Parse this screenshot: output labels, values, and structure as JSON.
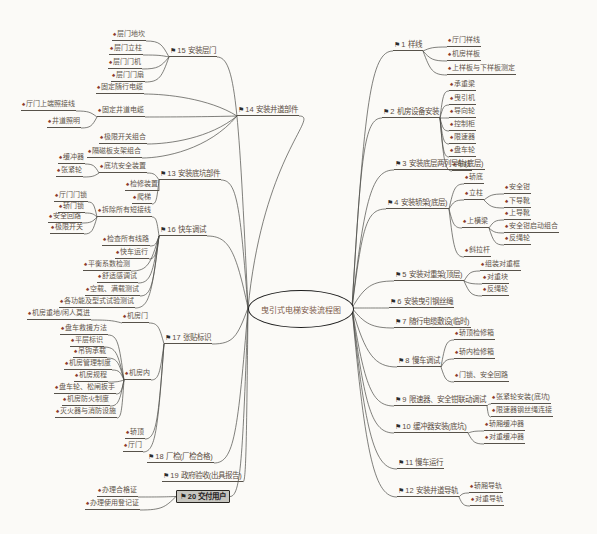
{
  "title": "曳引式电梯安装流程图",
  "center": {
    "label": "曳引式电梯安装流程图",
    "x": 300,
    "y": 308,
    "rx": 52,
    "ry": 18
  },
  "icons": {
    "main": "⚑",
    "sub": "♠"
  },
  "colors": {
    "line": "#4a4a46",
    "text": "#5f554b",
    "main_flag": "#2b2b2b",
    "sub_pin": "#8b3a2a",
    "background": "#fbfaf7",
    "box_fill": "#c6c5bf"
  },
  "nodes": [
    {
      "id": "n1",
      "parent": "center",
      "side": "right",
      "type": "main",
      "x": 393,
      "y": 40,
      "label": "1 样线"
    },
    {
      "id": "n1a",
      "parent": "n1",
      "side": "right",
      "type": "sub",
      "x": 447,
      "y": 35,
      "label": "厅门样线"
    },
    {
      "id": "n1b",
      "parent": "n1",
      "side": "right",
      "type": "sub",
      "x": 447,
      "y": 49,
      "label": "机房样板"
    },
    {
      "id": "n1c",
      "parent": "n1",
      "side": "right",
      "type": "sub",
      "x": 447,
      "y": 63,
      "label": "上样板与下样板测定"
    },
    {
      "id": "n2",
      "parent": "center",
      "side": "right",
      "type": "main",
      "x": 382,
      "y": 107,
      "label": "2 机房设备安装"
    },
    {
      "id": "n2a",
      "parent": "n2",
      "side": "right",
      "type": "sub",
      "x": 449,
      "y": 79,
      "label": "承重梁"
    },
    {
      "id": "n2b",
      "parent": "n2",
      "side": "right",
      "type": "sub",
      "x": 449,
      "y": 93,
      "label": "曳引机"
    },
    {
      "id": "n2c",
      "parent": "n2",
      "side": "right",
      "type": "sub",
      "x": 449,
      "y": 106,
      "label": "导向轮"
    },
    {
      "id": "n2d",
      "parent": "n2",
      "side": "right",
      "type": "sub",
      "x": 449,
      "y": 119,
      "label": "控制柜"
    },
    {
      "id": "n2e",
      "parent": "n2",
      "side": "right",
      "type": "sub",
      "x": 449,
      "y": 132,
      "label": "限速器"
    },
    {
      "id": "n2f",
      "parent": "n2",
      "side": "right",
      "type": "sub",
      "x": 449,
      "y": 145,
      "label": "盘车轮"
    },
    {
      "id": "n2g",
      "parent": "n2",
      "side": "right",
      "type": "sub",
      "x": 452,
      "y": 159,
      "label": "布线"
    },
    {
      "id": "n3",
      "parent": "center",
      "side": "right",
      "type": "main",
      "x": 394,
      "y": 159,
      "label": "3 安装底层两列导轨(底层)"
    },
    {
      "id": "n4",
      "parent": "center",
      "side": "right",
      "type": "main",
      "x": 386,
      "y": 198,
      "label": "4 安装轿架(底层)"
    },
    {
      "id": "n4a",
      "parent": "n4",
      "side": "right",
      "type": "sub",
      "x": 464,
      "y": 172,
      "label": "轿底"
    },
    {
      "id": "n4b",
      "parent": "n4",
      "side": "right",
      "type": "sub",
      "x": 464,
      "y": 188,
      "label": "立柱"
    },
    {
      "id": "n4b1",
      "parent": "n4b",
      "side": "right",
      "type": "sub",
      "x": 504,
      "y": 182,
      "label": "安全钳"
    },
    {
      "id": "n4b2",
      "parent": "n4b",
      "side": "right",
      "type": "sub",
      "x": 504,
      "y": 196,
      "label": "下导靴"
    },
    {
      "id": "n4c",
      "parent": "n4",
      "side": "right",
      "type": "sub",
      "x": 462,
      "y": 216,
      "label": "上横梁"
    },
    {
      "id": "n4c1",
      "parent": "n4c",
      "side": "right",
      "type": "sub",
      "x": 504,
      "y": 208,
      "label": "上导靴"
    },
    {
      "id": "n4c2",
      "parent": "n4c",
      "side": "right",
      "type": "sub",
      "x": 504,
      "y": 221,
      "label": "安全钳启动组合"
    },
    {
      "id": "n4c3",
      "parent": "n4c",
      "side": "right",
      "type": "sub",
      "x": 504,
      "y": 233,
      "label": "反绳轮"
    },
    {
      "id": "n4d",
      "parent": "n4",
      "side": "right",
      "type": "sub",
      "x": 464,
      "y": 245,
      "label": "斜拉杆"
    },
    {
      "id": "n5",
      "parent": "center",
      "side": "right",
      "type": "main",
      "x": 394,
      "y": 270,
      "label": "5 安装对重架(顶层)"
    },
    {
      "id": "n5a",
      "parent": "n5",
      "side": "right",
      "type": "sub",
      "x": 480,
      "y": 259,
      "label": "组装对重框"
    },
    {
      "id": "n5b",
      "parent": "n5",
      "side": "right",
      "type": "sub",
      "x": 482,
      "y": 272,
      "label": "对重块"
    },
    {
      "id": "n5c",
      "parent": "n5",
      "side": "right",
      "type": "sub",
      "x": 482,
      "y": 284,
      "label": "反绳轮"
    },
    {
      "id": "n6",
      "parent": "center",
      "side": "right",
      "type": "main",
      "x": 389,
      "y": 297,
      "label": "6 安装曳引钢丝绳"
    },
    {
      "id": "n7",
      "parent": "center",
      "side": "right",
      "type": "main",
      "x": 394,
      "y": 317,
      "label": "7 随行电缆敷设(临时)"
    },
    {
      "id": "n8",
      "parent": "center",
      "side": "right",
      "type": "main",
      "x": 397,
      "y": 356,
      "label": "8 慢车调试"
    },
    {
      "id": "n8a",
      "parent": "n8",
      "side": "right",
      "type": "sub",
      "x": 454,
      "y": 328,
      "label": "轿顶检修箱"
    },
    {
      "id": "n8b",
      "parent": "n8",
      "side": "right",
      "type": "sub",
      "x": 454,
      "y": 347,
      "label": "轿内检修箱"
    },
    {
      "id": "n8c",
      "parent": "n8",
      "side": "right",
      "type": "sub",
      "x": 454,
      "y": 370,
      "label": "门锁、安全回路"
    },
    {
      "id": "n9",
      "parent": "center",
      "side": "right",
      "type": "main",
      "x": 394,
      "y": 395,
      "label": "9 限速器、安全钳联动调试"
    },
    {
      "id": "n9a",
      "parent": "n9",
      "side": "right",
      "type": "sub",
      "x": 491,
      "y": 392,
      "label": "张紧轮安装(底坑)"
    },
    {
      "id": "n9b",
      "parent": "n9",
      "side": "right",
      "type": "sub",
      "x": 491,
      "y": 405,
      "label": "限速器钢丝绳连接"
    },
    {
      "id": "n10",
      "parent": "center",
      "side": "right",
      "type": "main",
      "x": 394,
      "y": 422,
      "label": "10 缓冲器安装(底坑)"
    },
    {
      "id": "n10a",
      "parent": "n10",
      "side": "right",
      "type": "sub",
      "x": 484,
      "y": 419,
      "label": "轿厢缓冲器"
    },
    {
      "id": "n10b",
      "parent": "n10",
      "side": "right",
      "type": "sub",
      "x": 484,
      "y": 432,
      "label": "对重缓冲器"
    },
    {
      "id": "n11",
      "parent": "center",
      "side": "right",
      "type": "main",
      "x": 397,
      "y": 458,
      "label": "11 慢车运行"
    },
    {
      "id": "n12",
      "parent": "center",
      "side": "right",
      "type": "main",
      "x": 397,
      "y": 486,
      "label": "12 安装井道导轨"
    },
    {
      "id": "n12a",
      "parent": "n12",
      "side": "right",
      "type": "sub",
      "x": 469,
      "y": 481,
      "label": "轿厢导轨"
    },
    {
      "id": "n12b",
      "parent": "n12",
      "side": "right",
      "type": "sub",
      "x": 470,
      "y": 494,
      "label": "对重导轨"
    },
    {
      "id": "n15",
      "parent": "center",
      "side": "left",
      "type": "main",
      "x": 169,
      "y": 46,
      "label": "15 安装层门"
    },
    {
      "id": "n15a",
      "parent": "n15",
      "side": "left",
      "type": "sub",
      "x": 112,
      "y": 29,
      "label": "层门地坎"
    },
    {
      "id": "n15b",
      "parent": "n15",
      "side": "left",
      "type": "sub",
      "x": 109,
      "y": 43,
      "label": "层门立柱"
    },
    {
      "id": "n15c",
      "parent": "n15",
      "side": "left",
      "type": "sub",
      "x": 108,
      "y": 57,
      "label": "层门门机"
    },
    {
      "id": "n15d",
      "parent": "n15",
      "side": "left",
      "type": "sub",
      "x": 111,
      "y": 70,
      "label": "层门门扇"
    },
    {
      "id": "n14",
      "parent": "center",
      "side": "left",
      "type": "main",
      "x": 237,
      "y": 105,
      "label": "14 安装井道部件"
    },
    {
      "id": "n14a",
      "parent": "n14",
      "side": "left",
      "type": "sub",
      "x": 96,
      "y": 82,
      "label": "固定随行电缆"
    },
    {
      "id": "n14b",
      "parent": "n14",
      "side": "left",
      "type": "sub",
      "x": 97,
      "y": 105,
      "label": "固定井道电缆"
    },
    {
      "id": "n14b1",
      "parent": "n14b",
      "side": "left",
      "type": "sub",
      "x": 21,
      "y": 99,
      "label": "厅门上端照接线"
    },
    {
      "id": "n14b2",
      "parent": "n14b",
      "side": "left",
      "type": "sub",
      "x": 47,
      "y": 116,
      "label": "井道照明"
    },
    {
      "id": "n14c",
      "parent": "n14",
      "side": "left",
      "type": "sub",
      "x": 99,
      "y": 132,
      "label": "极限开关组合"
    },
    {
      "id": "n14d",
      "parent": "n14",
      "side": "left",
      "type": "sub",
      "x": 87,
      "y": 146,
      "label": "隔磁板支架组合"
    },
    {
      "id": "n13",
      "parent": "center",
      "side": "left",
      "type": "main",
      "x": 159,
      "y": 169,
      "label": "13 安装底坑部件"
    },
    {
      "id": "n13a",
      "parent": "n13",
      "side": "left",
      "type": "sub",
      "x": 99,
      "y": 161,
      "label": "底坑安全装置"
    },
    {
      "id": "n13a1",
      "parent": "n13a",
      "side": "left",
      "type": "sub",
      "x": 58,
      "y": 152,
      "label": "缓冲器"
    },
    {
      "id": "n13a2",
      "parent": "n13a",
      "side": "left",
      "type": "sub",
      "x": 56,
      "y": 165,
      "label": "张紧轮"
    },
    {
      "id": "n13b",
      "parent": "n13",
      "side": "left",
      "type": "sub",
      "x": 125,
      "y": 179,
      "label": "检修装置"
    },
    {
      "id": "n13c",
      "parent": "n13",
      "side": "left",
      "type": "sub",
      "x": 132,
      "y": 192,
      "label": "爬梯"
    },
    {
      "id": "n16",
      "parent": "center",
      "side": "left",
      "type": "main",
      "x": 159,
      "y": 225,
      "label": "16 快车调试"
    },
    {
      "id": "n16a",
      "parent": "n16",
      "side": "left",
      "type": "sub",
      "x": 97,
      "y": 205,
      "label": "拆除所有短接线"
    },
    {
      "id": "n16a1",
      "parent": "n16a",
      "side": "left",
      "type": "sub",
      "x": 54,
      "y": 190,
      "label": "厅门门锁"
    },
    {
      "id": "n16a2",
      "parent": "n16a",
      "side": "left",
      "type": "sub",
      "x": 58,
      "y": 201,
      "label": "轿门锁"
    },
    {
      "id": "n16a3",
      "parent": "n16a",
      "side": "left",
      "type": "sub",
      "x": 48,
      "y": 211,
      "label": "安全回路"
    },
    {
      "id": "n16a4",
      "parent": "n16a",
      "side": "left",
      "type": "sub",
      "x": 50,
      "y": 222,
      "label": "极限开关"
    },
    {
      "id": "n16b",
      "parent": "n16",
      "side": "left",
      "type": "sub",
      "x": 102,
      "y": 234,
      "label": "检查所有线路"
    },
    {
      "id": "n16c",
      "parent": "n16",
      "side": "left",
      "type": "sub",
      "x": 115,
      "y": 247,
      "label": "快车运行"
    },
    {
      "id": "n16d",
      "parent": "n16",
      "side": "left",
      "type": "sub",
      "x": 83,
      "y": 259,
      "label": "平衡系数检测"
    },
    {
      "id": "n16e",
      "parent": "n16",
      "side": "left",
      "type": "sub",
      "x": 97,
      "y": 271,
      "label": "舒适感调试"
    },
    {
      "id": "n16f",
      "parent": "n16",
      "side": "left",
      "type": "sub",
      "x": 85,
      "y": 284,
      "label": "空载、满载测试"
    },
    {
      "id": "n16g",
      "parent": "n16",
      "side": "left",
      "type": "sub",
      "x": 59,
      "y": 296,
      "label": "各功能及型式试验测试"
    },
    {
      "id": "n17",
      "parent": "center",
      "side": "left",
      "type": "main",
      "x": 164,
      "y": 333,
      "label": "17 张贴标识"
    },
    {
      "id": "n17a",
      "parent": "n17",
      "side": "left",
      "type": "sub",
      "x": 122,
      "y": 311,
      "label": "机房门"
    },
    {
      "id": "n17a1",
      "parent": "n17a",
      "side": "left",
      "type": "sub",
      "x": 27,
      "y": 308,
      "label": "机房重地/闲人莫进"
    },
    {
      "id": "n17b",
      "parent": "n17",
      "side": "left",
      "type": "sub",
      "x": 124,
      "y": 368,
      "label": "机房内"
    },
    {
      "id": "n17b1",
      "parent": "n17b",
      "side": "left",
      "type": "sub",
      "x": 60,
      "y": 323,
      "label": "盘车救援方法"
    },
    {
      "id": "n17b2",
      "parent": "n17b",
      "side": "left",
      "type": "sub",
      "x": 70,
      "y": 335,
      "label": "平层标识"
    },
    {
      "id": "n17b3",
      "parent": "n17b",
      "side": "left",
      "type": "sub",
      "x": 73,
      "y": 346,
      "label": "吊钩承载"
    },
    {
      "id": "n17b4",
      "parent": "n17b",
      "side": "left",
      "type": "sub",
      "x": 64,
      "y": 358,
      "label": "机房管理制度"
    },
    {
      "id": "n17b5",
      "parent": "n17b",
      "side": "left",
      "type": "sub",
      "x": 74,
      "y": 370,
      "label": "机房规程"
    },
    {
      "id": "n17b6",
      "parent": "n17b",
      "side": "left",
      "type": "sub",
      "x": 54,
      "y": 382,
      "label": "盘车轮、松闸扳手"
    },
    {
      "id": "n17b7",
      "parent": "n17b",
      "side": "left",
      "type": "sub",
      "x": 62,
      "y": 394,
      "label": "机房防火制度"
    },
    {
      "id": "n17b8",
      "parent": "n17b",
      "side": "left",
      "type": "sub",
      "x": 55,
      "y": 406,
      "label": "灭火器与消防设施"
    },
    {
      "id": "n17c",
      "parent": "n17",
      "side": "left",
      "type": "sub",
      "x": 125,
      "y": 427,
      "label": "轿顶"
    },
    {
      "id": "n17d",
      "parent": "n17",
      "side": "left",
      "type": "sub",
      "x": 123,
      "y": 440,
      "label": "厅门"
    },
    {
      "id": "n18",
      "parent": "center",
      "side": "left",
      "type": "main",
      "x": 147,
      "y": 452,
      "label": "18 厂检(厂检合格)"
    },
    {
      "id": "n19",
      "parent": "center",
      "side": "left",
      "type": "main",
      "x": 162,
      "y": 471,
      "label": "19 政府验收(出具报告)"
    },
    {
      "id": "n20",
      "parent": "center",
      "side": "left",
      "type": "box",
      "x": 176,
      "y": 490,
      "label": "20 交付用户"
    },
    {
      "id": "n20a",
      "parent": "n20",
      "side": "left",
      "type": "sub",
      "x": 97,
      "y": 485,
      "label": "办理合格证"
    },
    {
      "id": "n20b",
      "parent": "n20",
      "side": "left",
      "type": "sub",
      "x": 85,
      "y": 498,
      "label": "办理使用登记证"
    }
  ]
}
